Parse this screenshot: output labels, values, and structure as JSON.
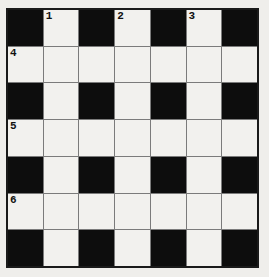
{
  "colors": {
    "background": "#efeeeb",
    "cell_white": "#f2f1ee",
    "cell_black": "#0d0d0d",
    "grid_line": "#7b7b7b",
    "grid_border": "#1a1a1a",
    "number_color": "#111111"
  },
  "grid": {
    "rows": 7,
    "cols": 7,
    "pattern": [
      "BWBWBWB",
      "WWWWWWW",
      "BWBWBWB",
      "WWWWWWW",
      "BWBWBWB",
      "WWWWWWW",
      "BWBWBWB"
    ],
    "numbers": [
      {
        "row": 1,
        "col": 2,
        "label": "1"
      },
      {
        "row": 1,
        "col": 4,
        "label": "2"
      },
      {
        "row": 1,
        "col": 6,
        "label": "3"
      },
      {
        "row": 2,
        "col": 1,
        "label": "4"
      },
      {
        "row": 4,
        "col": 1,
        "label": "5"
      },
      {
        "row": 6,
        "col": 1,
        "label": "6"
      }
    ]
  }
}
